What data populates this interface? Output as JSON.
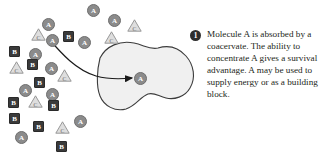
{
  "figure": {
    "background_color": "#ffffff",
    "width": 329,
    "height": 159
  },
  "caption": {
    "step_number": "1",
    "text": "Molecule A is absorbed by a coacervate. The ability to concentrate A gives a survival advantage. A may be used to supply energy or as a building block."
  },
  "coacervate": {
    "label": "coacervate",
    "fill_color": "#f0f0f0",
    "stroke_color": "#3c3c3c",
    "interior_molecule": {
      "kind": "circle",
      "letter": "A"
    }
  },
  "arrow": {
    "label": "absorption-arrow",
    "color": "#1a1a1a"
  },
  "legend": {
    "circle_letter": "A",
    "square_letter": "B",
    "triangle_letter": "C",
    "circle_color": "#8b8b8b",
    "square_color": "#3a3a3a",
    "triangle_color": "#8e8e8e"
  },
  "molecules": [
    {
      "kind": "circle",
      "letter": "A",
      "x": 87,
      "y": 4
    },
    {
      "kind": "circle",
      "letter": "A",
      "x": 42,
      "y": 18
    },
    {
      "kind": "circle",
      "letter": "A",
      "x": 108,
      "y": 14
    },
    {
      "kind": "triangle",
      "letter": "C",
      "x": 127,
      "y": 19
    },
    {
      "kind": "triangle",
      "letter": "C",
      "x": 31,
      "y": 28
    },
    {
      "kind": "circle",
      "letter": "A",
      "x": 46,
      "y": 34
    },
    {
      "kind": "square",
      "letter": "B",
      "x": 63,
      "y": 31
    },
    {
      "kind": "circle",
      "letter": "A",
      "x": 78,
      "y": 36
    },
    {
      "kind": "triangle",
      "letter": "C",
      "x": 104,
      "y": 31
    },
    {
      "kind": "square",
      "letter": "B",
      "x": 9,
      "y": 46
    },
    {
      "kind": "circle",
      "letter": "A",
      "x": 29,
      "y": 48
    },
    {
      "kind": "triangle",
      "letter": "C",
      "x": 9,
      "y": 61
    },
    {
      "kind": "square",
      "letter": "B",
      "x": 27,
      "y": 59
    },
    {
      "kind": "circle",
      "letter": "A",
      "x": 45,
      "y": 62
    },
    {
      "kind": "triangle",
      "letter": "C",
      "x": 57,
      "y": 69
    },
    {
      "kind": "square",
      "letter": "B",
      "x": 34,
      "y": 77
    },
    {
      "kind": "circle",
      "letter": "A",
      "x": 19,
      "y": 84
    },
    {
      "kind": "circle",
      "letter": "A",
      "x": 46,
      "y": 88
    },
    {
      "kind": "square",
      "letter": "B",
      "x": 8,
      "y": 97
    },
    {
      "kind": "triangle",
      "letter": "C",
      "x": 28,
      "y": 95
    },
    {
      "kind": "square",
      "letter": "B",
      "x": 48,
      "y": 100
    },
    {
      "kind": "square",
      "letter": "B",
      "x": 9,
      "y": 113
    },
    {
      "kind": "square",
      "letter": "B",
      "x": 33,
      "y": 121
    },
    {
      "kind": "triangle",
      "letter": "C",
      "x": 55,
      "y": 121
    },
    {
      "kind": "circle",
      "letter": "A",
      "x": 74,
      "y": 115
    },
    {
      "kind": "circle",
      "letter": "A",
      "x": 15,
      "y": 131
    },
    {
      "kind": "square",
      "letter": "B",
      "x": 56,
      "y": 141
    }
  ]
}
